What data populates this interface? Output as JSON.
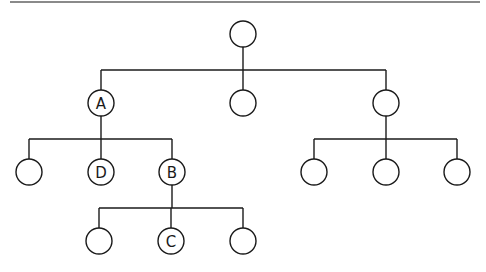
{
  "diagram": {
    "type": "tree",
    "colors": {
      "stroke": "#1a1a1a",
      "rule": "#8a8a8a",
      "background": "#ffffff"
    },
    "nodes": [
      {
        "id": "root",
        "label": "",
        "parent": null
      },
      {
        "id": "n1",
        "label": "A",
        "parent": "root"
      },
      {
        "id": "n2",
        "label": "",
        "parent": "root"
      },
      {
        "id": "n3",
        "label": "",
        "parent": "root"
      },
      {
        "id": "n1a",
        "label": "",
        "parent": "n1"
      },
      {
        "id": "n1b",
        "label": "D",
        "parent": "n1"
      },
      {
        "id": "n1c",
        "label": "B",
        "parent": "n1"
      },
      {
        "id": "n3a",
        "label": "",
        "parent": "n3"
      },
      {
        "id": "n3b",
        "label": "",
        "parent": "n3"
      },
      {
        "id": "n3c",
        "label": "",
        "parent": "n3"
      },
      {
        "id": "n1ca",
        "label": "",
        "parent": "n1c"
      },
      {
        "id": "n1cb",
        "label": "C",
        "parent": "n1c"
      },
      {
        "id": "n1cc",
        "label": "",
        "parent": "n1c"
      }
    ]
  }
}
